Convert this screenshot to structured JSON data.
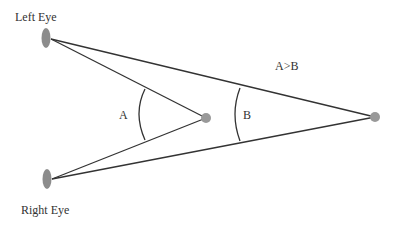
{
  "diagram": {
    "labels": {
      "left_eye": "Left Eye",
      "right_eye": "Right Eye",
      "angle_a": "A",
      "angle_b": "B",
      "relation": "A>B"
    },
    "colors": {
      "line": "#333333",
      "eye_fill": "#8c8c8c",
      "point_fill": "#999999",
      "background": "#ffffff"
    },
    "points": {
      "left_eye": [
        46,
        38
      ],
      "right_eye": [
        47,
        179
      ],
      "near_target": [
        206,
        118
      ],
      "far_target": [
        375,
        117
      ]
    }
  }
}
